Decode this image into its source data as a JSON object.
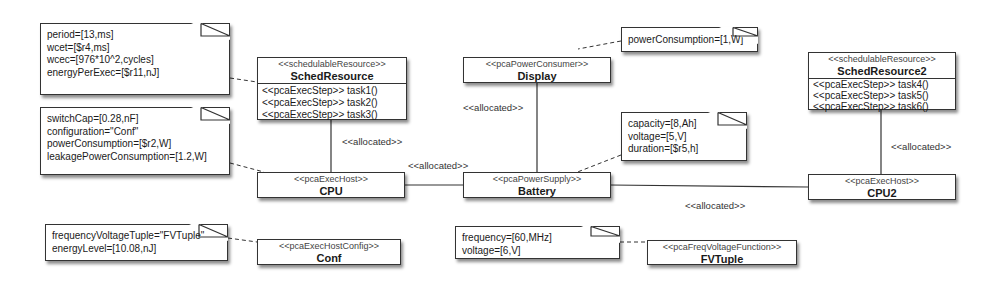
{
  "notes": {
    "sched_props": [
      "period=[13,ms]",
      "wcet=[$r4,ms]",
      "wcec=[976*10^2,cycles]",
      "energyPerExec=[$r11,nJ]"
    ],
    "cpu_props": [
      "switchCap=[0.28,nF]",
      "configuration=\"Conf\"",
      "powerConsumption=[$r2,W]",
      "leakagePowerConsumption=[1.2,W]"
    ],
    "conf_props": [
      "frequencyVoltageTuple=\"FVTuple\"",
      "energyLevel=[10.08,nJ]"
    ],
    "display_props": [
      "powerConsumption=[1,W]"
    ],
    "battery_props": [
      "capacity=[8,Ah]",
      "voltage=[5,V]",
      "duration=[$r5,h]"
    ],
    "fvtuple_props": [
      "frequency=[60,MHz]",
      "voltage=[6,V]"
    ]
  },
  "classes": {
    "sched1": {
      "stereotype": "<<schedulableResource>>",
      "name": "SchedResource",
      "ops": [
        "<<pcaExecStep>> task1()",
        "<<pcaExecStep>> task2()",
        "<<pcaExecStep>> task3()"
      ]
    },
    "sched2": {
      "stereotype": "<<schedulableResource>>",
      "name": "SchedResource2",
      "ops": [
        "<<pcaExecStep>> task4()",
        "<<pcaExecStep>> task5()",
        "<<pcaExecStep>> task6()"
      ]
    },
    "cpu": {
      "stereotype": "<<pcaExecHost>>",
      "name": "CPU"
    },
    "cpu2": {
      "stereotype": "<<pcaExecHost>>",
      "name": "CPU2"
    },
    "display": {
      "stereotype": "<<pcaPowerConsumer>>",
      "name": "Display"
    },
    "battery": {
      "stereotype": "<<pcaPowerSupply>>",
      "name": "Battery"
    },
    "conf": {
      "stereotype": "<<pcaExecHostConfig>>",
      "name": "Conf"
    },
    "fvtuple": {
      "stereotype": "<<pcaFreqVoltageFunction>>",
      "name": "FVTuple"
    }
  },
  "associations": {
    "sched_cpu": "<<allocated>>",
    "cpu_battery": "<<allocated>>",
    "display_battery": "<<allocated>>",
    "battery_cpu2": "<<allocated>>",
    "sched2_cpu2": "<<allocated>>"
  }
}
